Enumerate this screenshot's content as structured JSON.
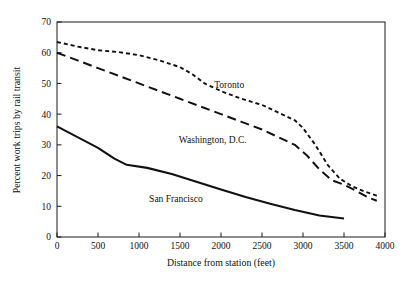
{
  "chart_data": {
    "type": "line",
    "title": "",
    "xlabel": "Distance from station (feet)",
    "ylabel": "Percent work trips by rail transit",
    "xlim": [
      0,
      4000
    ],
    "ylim": [
      0,
      70
    ],
    "xticks": [
      0,
      500,
      1000,
      1500,
      2000,
      2500,
      3000,
      3500,
      4000
    ],
    "xtick_labels": [
      "0",
      "500",
      "1000",
      "1500",
      "2000",
      "2500",
      "3000",
      "3500",
      "4000"
    ],
    "yticks": [
      0,
      10,
      20,
      30,
      40,
      50,
      60,
      70
    ],
    "ytick_labels": [
      "0",
      "10",
      "20",
      "30",
      "40",
      "50",
      "60",
      "70"
    ],
    "grid": false,
    "legend_position": "inline-annotations",
    "series": [
      {
        "name": "Toronto",
        "style": "dotted",
        "color": "#111111",
        "label_x": 2100,
        "label_y": 48.5,
        "points": [
          [
            0,
            63.5
          ],
          [
            250,
            62.0
          ],
          [
            500,
            60.8
          ],
          [
            750,
            60.2
          ],
          [
            1000,
            59.2
          ],
          [
            1250,
            57.5
          ],
          [
            1500,
            55.3
          ],
          [
            1650,
            53.0
          ],
          [
            1800,
            50.0
          ],
          [
            2000,
            47.5
          ],
          [
            2250,
            45.0
          ],
          [
            2500,
            43.0
          ],
          [
            2700,
            40.5
          ],
          [
            2900,
            38.0
          ],
          [
            3000,
            35.5
          ],
          [
            3150,
            30.0
          ],
          [
            3300,
            23.5
          ],
          [
            3450,
            19.0
          ],
          [
            3600,
            16.5
          ],
          [
            3750,
            14.8
          ],
          [
            3900,
            13.5
          ]
        ]
      },
      {
        "name": "Washington, D.C.",
        "style": "dashed",
        "color": "#111111",
        "label_x": 1900,
        "label_y": 30.5,
        "points": [
          [
            0,
            60.0
          ],
          [
            250,
            57.5
          ],
          [
            500,
            55.0
          ],
          [
            750,
            52.5
          ],
          [
            1000,
            50.0
          ],
          [
            1250,
            47.5
          ],
          [
            1500,
            45.0
          ],
          [
            1750,
            42.5
          ],
          [
            2000,
            40.0
          ],
          [
            2250,
            37.5
          ],
          [
            2500,
            35.0
          ],
          [
            2700,
            32.5
          ],
          [
            2900,
            30.0
          ],
          [
            3050,
            26.5
          ],
          [
            3200,
            22.0
          ],
          [
            3350,
            18.5
          ],
          [
            3500,
            17.0
          ],
          [
            3650,
            15.0
          ],
          [
            3800,
            12.8
          ],
          [
            3900,
            11.8
          ]
        ]
      },
      {
        "name": "San Francisco",
        "style": "solid",
        "color": "#111111",
        "label_x": 1450,
        "label_y": 11.5,
        "points": [
          [
            0,
            36.0
          ],
          [
            250,
            32.5
          ],
          [
            500,
            29.0
          ],
          [
            700,
            25.5
          ],
          [
            850,
            23.5
          ],
          [
            1100,
            22.5
          ],
          [
            1400,
            20.5
          ],
          [
            1700,
            18.0
          ],
          [
            2000,
            15.5
          ],
          [
            2300,
            13.0
          ],
          [
            2600,
            10.8
          ],
          [
            2900,
            8.8
          ],
          [
            3200,
            7.0
          ],
          [
            3500,
            6.0
          ]
        ]
      }
    ]
  }
}
